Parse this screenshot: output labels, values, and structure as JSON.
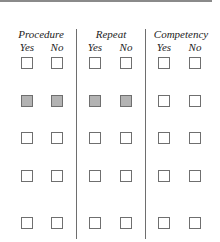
{
  "form": {
    "groups": [
      {
        "title": "Procedure",
        "yes": "Yes",
        "no": "No"
      },
      {
        "title": "Repeat",
        "yes": "Yes",
        "no": "No"
      },
      {
        "title": "Competency",
        "yes": "Yes",
        "no": "No"
      }
    ],
    "rows": [
      {
        "procedure_yes": false,
        "procedure_no": false,
        "repeat_yes": false,
        "repeat_no": false,
        "competency_yes": false,
        "competency_no": false,
        "shaded": []
      },
      {
        "procedure_yes": false,
        "procedure_no": false,
        "repeat_yes": false,
        "repeat_no": false,
        "competency_yes": false,
        "competency_no": false,
        "shaded": [
          "procedure_yes",
          "procedure_no",
          "repeat_yes",
          "repeat_no"
        ]
      },
      {
        "procedure_yes": false,
        "procedure_no": false,
        "repeat_yes": false,
        "repeat_no": false,
        "competency_yes": false,
        "competency_no": false,
        "shaded": []
      },
      {
        "procedure_yes": false,
        "procedure_no": false,
        "repeat_yes": false,
        "repeat_no": false,
        "competency_yes": false,
        "competency_no": false,
        "shaded": []
      },
      {
        "procedure_yes": false,
        "procedure_no": false,
        "repeat_yes": false,
        "repeat_no": false,
        "competency_yes": false,
        "competency_no": false,
        "shaded": []
      }
    ],
    "colors": {
      "border": "#6f6f6f",
      "shaded_fill": "#b3b3b3",
      "divider": "#6e6e6e"
    }
  }
}
